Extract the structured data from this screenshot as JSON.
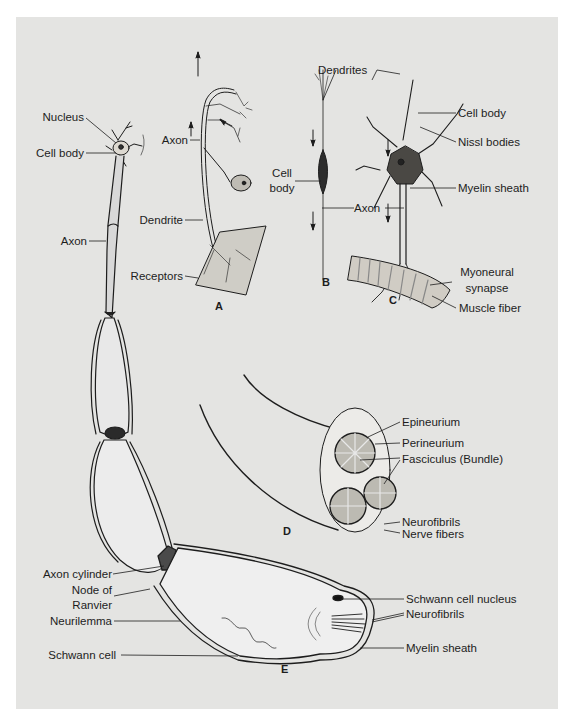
{
  "diagram": {
    "background_color": "#e4e4e2",
    "line_color": "#1d1d1d",
    "panels": [
      {
        "id": "A",
        "label": "A"
      },
      {
        "id": "B",
        "label": "B"
      },
      {
        "id": "C",
        "label": "C"
      },
      {
        "id": "D",
        "label": "D"
      },
      {
        "id": "E",
        "label": "E"
      }
    ],
    "labels": {
      "left_neuron": {
        "nucleus": "Nucleus",
        "cell_body": "Cell body",
        "axon": "Axon"
      },
      "A": {
        "axon": "Axon",
        "cell_body_line1": "Cell",
        "cell_body_line2": "body",
        "dendrite": "Dendrite",
        "receptors": "Receptors"
      },
      "B": {
        "dendrites": "Dendrites",
        "axon": "Axon"
      },
      "C": {
        "cell_body": "Cell body",
        "nissl_bodies": "Nissl bodies",
        "myelin_sheath": "Myelin sheath",
        "myoneural_line1": "Myoneural",
        "myoneural_line2": "synapse",
        "muscle_fiber": "Muscle fiber"
      },
      "D": {
        "epineurium": "Epineurium",
        "perineurium": "Perineurium",
        "fasciculus": "Fasciculus (Bundle)",
        "neurofibrils": "Neurofibrils",
        "nerve_fibers": "Nerve fibers"
      },
      "E": {
        "axon_cylinder": "Axon cylinder",
        "node_line1": "Node of",
        "node_line2": "Ranvier",
        "neurilemma": "Neurilemma",
        "schwann_cell": "Schwann cell",
        "schwann_nucleus": "Schwann cell nucleus",
        "neurofibrils": "Neurofibrils",
        "myelin_sheath": "Myelin sheath"
      }
    }
  }
}
